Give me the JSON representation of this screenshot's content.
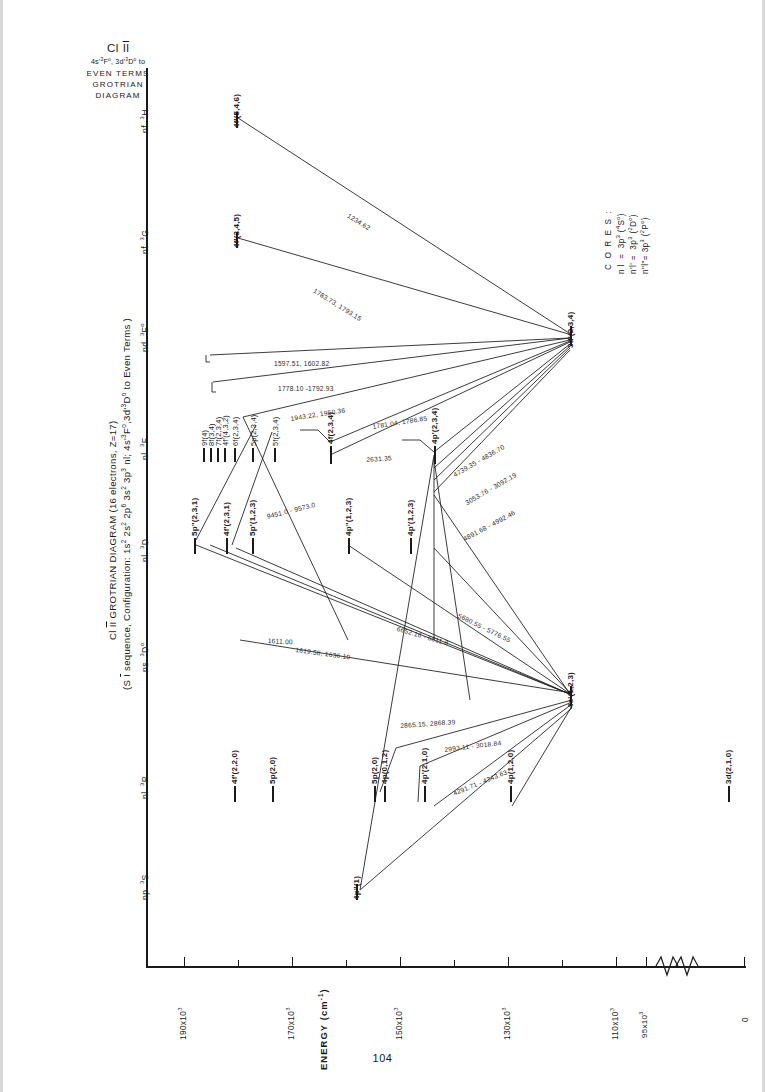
{
  "title_block": {
    "line1": "Cl II",
    "line2": "4s'3F°, 3d'3D° to",
    "line3": "EVEN TERMS",
    "line4": "GROTRIAN",
    "line5": "DIAGRAM"
  },
  "side_title": {
    "line1": "Cl II GROTRIAN DIAGRAM (16 electrons, Z=17)",
    "line2": "(S I sequence, Configuration: 1s2 2s2 2p6 3s2 3p3 nl; 4s'3F°,3d'3D° to Even Terms )"
  },
  "axis": {
    "label": "ENERGY  (cm-1)",
    "ticks": [
      {
        "value": "190x103",
        "major": true
      },
      {
        "value": "170x103",
        "major": true
      },
      {
        "value": "150x103",
        "major": true
      },
      {
        "value": "130x103",
        "major": true
      },
      {
        "value": "110x103",
        "major": true
      },
      {
        "value": "95x103",
        "major": true
      },
      {
        "value": "0",
        "major": true
      }
    ],
    "break_note": "axis break between 95x10^3 and 0"
  },
  "columns": [
    {
      "id": "np-3S",
      "series": "np",
      "term": "3S"
    },
    {
      "id": "nl-3P",
      "series": "nl",
      "term": "3P"
    },
    {
      "id": "ns-3Do",
      "series": "ns",
      "term": "3D°"
    },
    {
      "id": "nl-3D",
      "series": "nl",
      "term": "3D"
    },
    {
      "id": "nl-3F",
      "series": "nl",
      "term": "3F"
    },
    {
      "id": "nd-3Fo",
      "series": "nd",
      "term": "3F°"
    },
    {
      "id": "nf-3G",
      "series": "nf",
      "term": "3G"
    },
    {
      "id": "nf-3H",
      "series": "nf",
      "term": "3H"
    }
  ],
  "cores": {
    "heading": "C O R E S :",
    "items": [
      "n l  =  3p3 (4S°)",
      "n'l' =  3p3 (2D°)",
      "n\"l\" = 3p3 (2P°)"
    ]
  },
  "levels": [
    {
      "label": "4p\"(1)",
      "column": "np-3S"
    },
    {
      "label": "4f'(2,2,0)",
      "column": "nl-3P"
    },
    {
      "label": "5p(2,0)",
      "column": "nl-3P"
    },
    {
      "label": "5p(2,0)",
      "column": "nl-3P"
    },
    {
      "label": "4p(0,1,2)",
      "column": "nl-3P"
    },
    {
      "label": "4p'(2,1,0)",
      "column": "nl-3P"
    },
    {
      "label": "4p(1,2,0)",
      "column": "nl-3P"
    },
    {
      "label": "3d(2,1,0)",
      "column": "nl-3P"
    },
    {
      "label": "4s'(1,2,3)",
      "column": "ns-3Do"
    },
    {
      "label": "5p\"(2,3,1)",
      "column": "nl-3D"
    },
    {
      "label": "4f'(2,3,1)",
      "column": "nl-3D"
    },
    {
      "label": "5p'(1,2,3)",
      "column": "nl-3D"
    },
    {
      "label": "4p\"(1,2,3)",
      "column": "nl-3D"
    },
    {
      "label": "4p'(1,2,3)",
      "column": "nl-3D"
    },
    {
      "label": "9f(4)",
      "column": "nl-3F"
    },
    {
      "label": "8f(3,4)",
      "column": "nl-3F"
    },
    {
      "label": "7f(2,3,4)",
      "column": "nl-3F"
    },
    {
      "label": "4f'(4,3,2)",
      "column": "nl-3F"
    },
    {
      "label": "6f(2,3,4)",
      "column": "nl-3F"
    },
    {
      "label": "5p(2,3,4)",
      "column": "nl-3F"
    },
    {
      "label": "5f(2,3,4)",
      "column": "nl-3F"
    },
    {
      "label": "4f(2,3,4)",
      "column": "nl-3F"
    },
    {
      "label": "4p'(2,3,4)",
      "column": "nl-3F"
    },
    {
      "label": "3d'(2,3,4)",
      "column": "nd-3Fo"
    },
    {
      "label": "4f'(3,4,5)",
      "column": "nf-3G"
    },
    {
      "label": "4f'(5,4,6)",
      "column": "nf-3H"
    }
  ],
  "transitions": [
    {
      "label": "1597.51, 1602.82"
    },
    {
      "label": "1778.10 -1792.93"
    },
    {
      "label": "1943.22, 1950.36"
    },
    {
      "label": "1781.04, 1786.85"
    },
    {
      "label": "2631.35"
    },
    {
      "label": "1783.73, 1793.15"
    },
    {
      "label": "1234.62"
    },
    {
      "label": "4739.35 - 4836.70"
    },
    {
      "label": "3053.76 - 3092.19"
    },
    {
      "label": "4891.68 - 4992.46"
    },
    {
      "label": "9451.0 - 9573.0"
    },
    {
      "label": "6652.16 - 6811.8"
    },
    {
      "label": "5680.55 - 5776.55"
    },
    {
      "label": "1619.58, 1636.10"
    },
    {
      "label": "1611.00"
    },
    {
      "label": "2865.15, 2868.39"
    },
    {
      "label": "2993.11 - 3018.84"
    },
    {
      "label": "4291.71 - 4343.63"
    }
  ],
  "page_number": "104"
}
